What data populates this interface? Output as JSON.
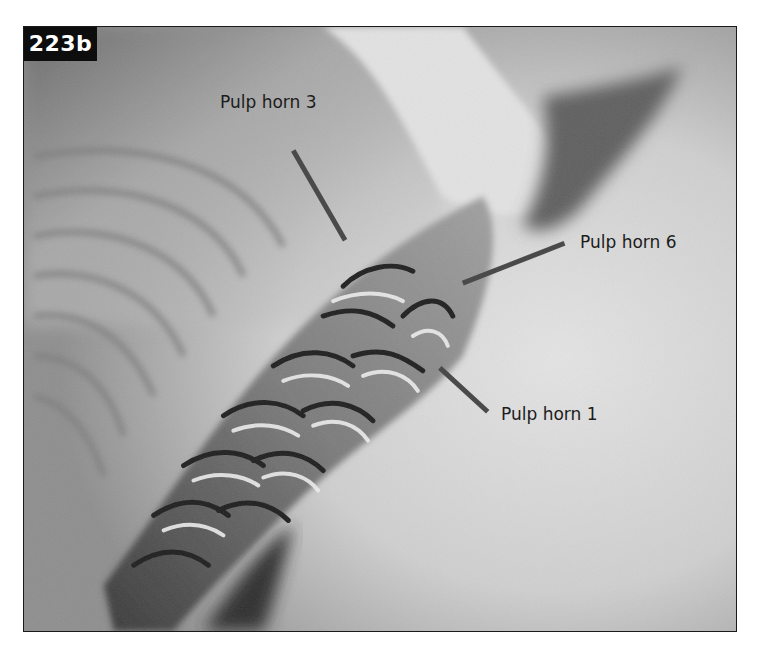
{
  "figure": {
    "number": "223b",
    "labels": [
      {
        "id": "pulp-horn-3",
        "text": "Pulp horn 3"
      },
      {
        "id": "pulp-horn-6",
        "text": "Pulp horn 6"
      },
      {
        "id": "pulp-horn-1",
        "text": "Pulp horn 1"
      }
    ]
  },
  "colors": {
    "frame_border": "#1a1a1a",
    "number_box_bg": "#0d0d0d",
    "number_text": "#ffffff",
    "label_text": "#1c1c1c",
    "arrow": "#4a4a4a"
  }
}
